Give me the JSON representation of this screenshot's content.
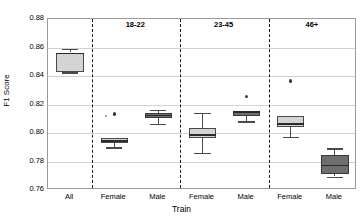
{
  "chart_data": {
    "type": "box",
    "title": "",
    "xlabel": "Train",
    "ylabel": "F1 Score",
    "ylim": [
      0.76,
      0.88
    ],
    "yticks": [
      "0.76",
      "0.78",
      "0.80",
      "0.82",
      "0.84",
      "0.86",
      "0.88"
    ],
    "grid": true,
    "legend": "none",
    "group_labels": [
      "18-22",
      "23-45",
      "46+"
    ],
    "categories": [
      "All",
      "Female",
      "Male",
      "Female",
      "Male",
      "Female",
      "Male"
    ],
    "boxes": [
      {
        "label": "All",
        "group": "",
        "shade": "light",
        "whisker_low": 0.8425,
        "q1": 0.8428,
        "median": 0.8558,
        "q3": 0.8565,
        "whisker_high": 0.8592,
        "outliers": []
      },
      {
        "label": "Female",
        "group": "18-22",
        "shade": "light",
        "whisker_low": 0.7895,
        "q1": 0.7932,
        "median": 0.7945,
        "q3": 0.7962,
        "whisker_high": 0.79,
        "outliers": [
          0.8133,
          0.8121
        ]
      },
      {
        "label": "Male",
        "group": "18-22",
        "shade": "dark",
        "whisker_low": 0.8062,
        "q1": 0.8105,
        "median": 0.8122,
        "q3": 0.8138,
        "whisker_high": 0.8165,
        "outliers": []
      },
      {
        "label": "Female",
        "group": "23-45",
        "shade": "light",
        "whisker_low": 0.7858,
        "q1": 0.7968,
        "median": 0.7985,
        "q3": 0.8035,
        "whisker_high": 0.814,
        "outliers": []
      },
      {
        "label": "Male",
        "group": "23-45",
        "shade": "dark",
        "whisker_low": 0.8078,
        "q1": 0.8118,
        "median": 0.8148,
        "q3": 0.8158,
        "whisker_high": 0.8082,
        "outliers": [
          0.8258
        ]
      },
      {
        "label": "Female",
        "group": "46+",
        "shade": "light",
        "whisker_low": 0.7975,
        "q1": 0.8045,
        "median": 0.8062,
        "q3": 0.8118,
        "whisker_high": 0.812,
        "outliers": [
          0.8365
        ]
      },
      {
        "label": "Male",
        "group": "46+",
        "shade": "dark",
        "whisker_low": 0.7695,
        "q1": 0.7715,
        "median": 0.7772,
        "q3": 0.7848,
        "whisker_high": 0.7892,
        "outliers": []
      }
    ]
  }
}
